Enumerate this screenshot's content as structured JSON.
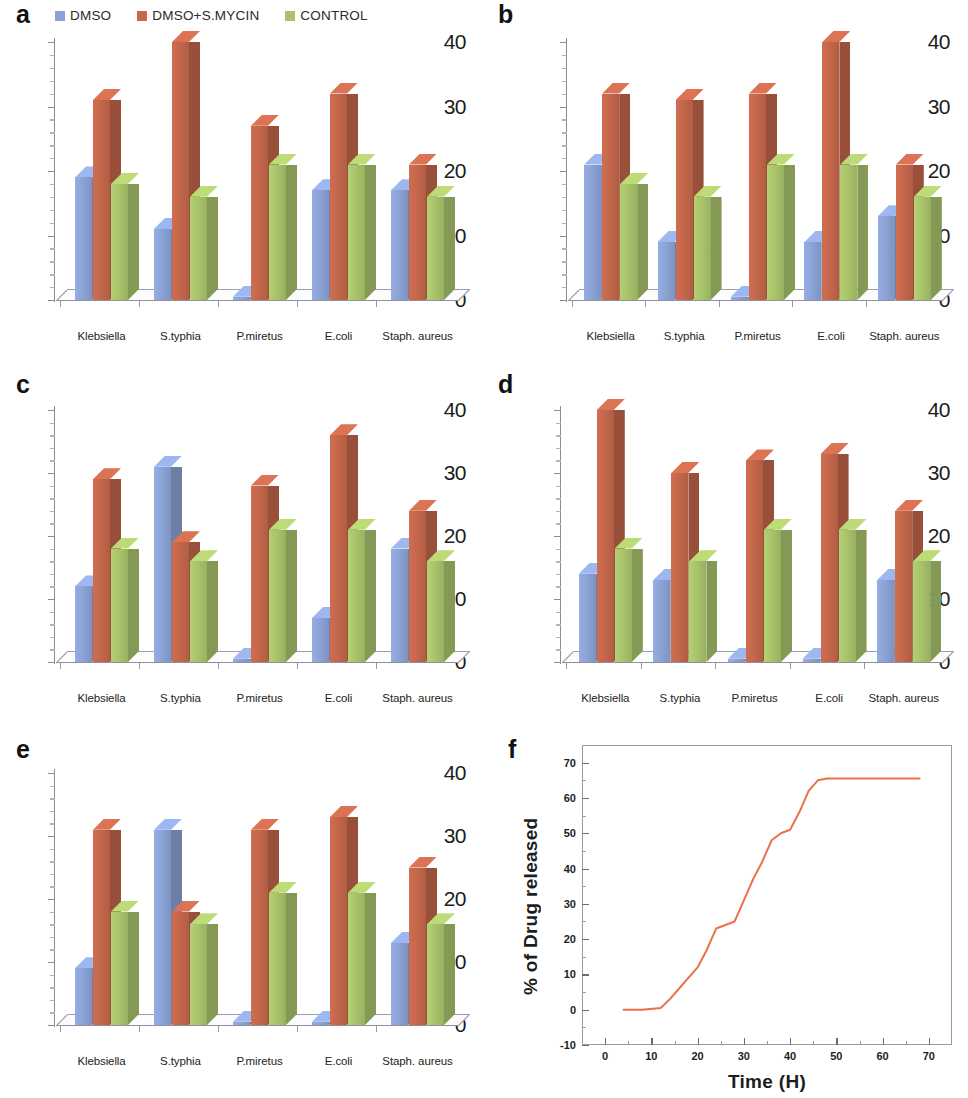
{
  "figure": {
    "panels": [
      "a",
      "b",
      "c",
      "d",
      "e",
      "f"
    ]
  },
  "legend": {
    "items": [
      {
        "label": "DMSO",
        "color": "#8CA3D6"
      },
      {
        "label": "DMSO+S.MYCIN",
        "color": "#C4674B"
      },
      {
        "label": "CONTROL",
        "color": "#A9C46B"
      }
    ]
  },
  "series_colors": {
    "dmso": "#8CA3D6",
    "dmso_smycin": "#C4674B",
    "control": "#A9C46B"
  },
  "panel_letters": {
    "a": "a",
    "b": "b",
    "c": "c",
    "d": "d",
    "e": "e",
    "f": "f"
  },
  "chart_data": [
    {
      "panel": "a",
      "type": "bar",
      "title": "",
      "xlabel": "",
      "ylabel": "",
      "ylim": [
        0,
        40
      ],
      "yticks": [
        0,
        10,
        20,
        30,
        40
      ],
      "grid": false,
      "legend_position": "top",
      "categories": [
        "Klebsiella",
        "S.typhia",
        "P.miretus",
        "E.coli",
        "Staph. aureus"
      ],
      "series": [
        {
          "name": "DMSO",
          "values": [
            19,
            11,
            0.5,
            17,
            17
          ]
        },
        {
          "name": "DMSO+S.MYCIN",
          "values": [
            31,
            40,
            27,
            32,
            21
          ]
        },
        {
          "name": "CONTROL",
          "values": [
            18,
            16,
            21,
            21,
            16
          ]
        }
      ]
    },
    {
      "panel": "b",
      "type": "bar",
      "title": "",
      "xlabel": "",
      "ylabel": "",
      "ylim": [
        0,
        40
      ],
      "yticks": [
        0,
        10,
        20,
        30,
        40
      ],
      "grid": false,
      "legend_position": "none",
      "categories": [
        "Klebsiella",
        "S.typhia",
        "P.miretus",
        "E.coli",
        "Staph. aureus"
      ],
      "series": [
        {
          "name": "DMSO",
          "values": [
            21,
            9,
            0.5,
            9,
            13
          ]
        },
        {
          "name": "DMSO+S.MYCIN",
          "values": [
            32,
            31,
            32,
            40,
            21
          ]
        },
        {
          "name": "CONTROL",
          "values": [
            18,
            16,
            21,
            21,
            16
          ]
        }
      ]
    },
    {
      "panel": "c",
      "type": "bar",
      "title": "",
      "xlabel": "",
      "ylabel": "",
      "ylim": [
        0,
        40
      ],
      "yticks": [
        0,
        10,
        20,
        30,
        40
      ],
      "grid": false,
      "legend_position": "none",
      "categories": [
        "Klebsiella",
        "S.typhia",
        "P.miretus",
        "E.coli",
        "Staph. aureus"
      ],
      "series": [
        {
          "name": "DMSO",
          "values": [
            12,
            31,
            0.5,
            7,
            18
          ]
        },
        {
          "name": "DMSO+S.MYCIN",
          "values": [
            29,
            19,
            28,
            36,
            24
          ]
        },
        {
          "name": "CONTROL",
          "values": [
            18,
            16,
            21,
            21,
            16
          ]
        }
      ]
    },
    {
      "panel": "d",
      "type": "bar",
      "title": "",
      "xlabel": "",
      "ylabel": "",
      "ylim": [
        0,
        40
      ],
      "yticks": [
        0,
        10,
        20,
        30,
        40
      ],
      "grid": false,
      "legend_position": "none",
      "categories": [
        "Klebsiella",
        "S.typhia",
        "P.miretus",
        "E.coli",
        "Staph. aureus"
      ],
      "series": [
        {
          "name": "DMSO",
          "values": [
            14,
            13,
            0.5,
            0.5,
            13
          ]
        },
        {
          "name": "DMSO+S.MYCIN",
          "values": [
            40,
            30,
            32,
            33,
            24
          ]
        },
        {
          "name": "CONTROL",
          "values": [
            18,
            16,
            21,
            21,
            16
          ]
        }
      ]
    },
    {
      "panel": "e",
      "type": "bar",
      "title": "",
      "xlabel": "",
      "ylabel": "",
      "ylim": [
        0,
        40
      ],
      "yticks": [
        0,
        10,
        20,
        30,
        40
      ],
      "grid": false,
      "legend_position": "none",
      "categories": [
        "Klebsiella",
        "S.typhia",
        "P.miretus",
        "E.coli",
        "Staph. aureus"
      ],
      "series": [
        {
          "name": "DMSO",
          "values": [
            9,
            31,
            0.5,
            0.5,
            13
          ]
        },
        {
          "name": "DMSO+S.MYCIN",
          "values": [
            31,
            18,
            31,
            33,
            25
          ]
        },
        {
          "name": "CONTROL",
          "values": [
            18,
            16,
            21,
            21,
            16
          ]
        }
      ]
    },
    {
      "panel": "f",
      "type": "line",
      "title": "",
      "xlabel": "Time (H)",
      "ylabel": "% of Drug released",
      "xlim": [
        -5,
        75
      ],
      "ylim": [
        -10,
        75
      ],
      "xticks": [
        0,
        10,
        20,
        30,
        40,
        50,
        60,
        70
      ],
      "yticks": [
        -10,
        0,
        10,
        20,
        30,
        40,
        50,
        60,
        70
      ],
      "grid": false,
      "legend_position": "none",
      "line_color": "#E8714A",
      "series": [
        {
          "name": "% of Drug released",
          "x": [
            4,
            8,
            12,
            14,
            16,
            18,
            20,
            22,
            24,
            26,
            28,
            29,
            30,
            32,
            34,
            36,
            38,
            40,
            42,
            44,
            46,
            48,
            52,
            56,
            60,
            64,
            68
          ],
          "y": [
            0,
            0,
            0.5,
            3,
            6,
            9,
            12,
            17,
            23,
            24,
            25,
            28,
            31,
            37,
            42,
            48,
            50,
            51,
            56,
            62,
            65,
            65.5,
            65.5,
            65.5,
            65.5,
            65.5,
            65.5
          ]
        }
      ]
    }
  ]
}
